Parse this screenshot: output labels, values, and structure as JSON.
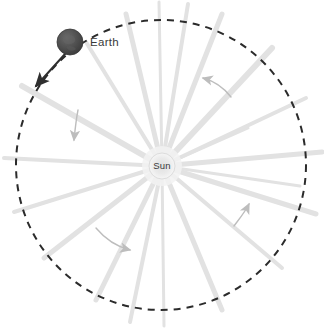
{
  "figure": {
    "background_color": "#ffffff"
  },
  "sun": {
    "label": "Sun",
    "center_x": 162,
    "center_y": 166,
    "radius": 13,
    "fill_color": "#e6e6e6",
    "label_color": "#4a4a4a"
  },
  "earth": {
    "label": "Earth",
    "center_x": 70,
    "center_y": 42,
    "radius": 13,
    "fill_color": "#4a4a4a",
    "label_color": "#3a3a3a",
    "label_x": 90,
    "label_y": 46
  },
  "orbit": {
    "name": "orbit-path",
    "center_x": 161,
    "center_y": 165,
    "radius": 145,
    "stroke_color": "#2b2b2b",
    "stroke_width": 2,
    "dash_pattern": "7 6"
  },
  "velocity_arrow": {
    "name": "earth-velocity-arrow",
    "color": "#2f2f2f",
    "from_x": 66,
    "from_y": 54,
    "to_x": 36,
    "to_y": 86,
    "description": "Earth velocity direction, tangent to orbit, pointing down-left"
  },
  "rays": {
    "color": "#e2e2e2",
    "count": 18,
    "description": "Sunlight rays radiating from the Sun outward past the orbit",
    "angles_deg": [
      5,
      25,
      48,
      70,
      88,
      103,
      122,
      140,
      158,
      178,
      196,
      212,
      232,
      250,
      268,
      288,
      310,
      332
    ]
  },
  "direction_arrows": [
    {
      "name": "direction-arrow-upper-right",
      "color": "#bdbdbd",
      "description": "curved arrow pointing up-left in upper right quadrant"
    },
    {
      "name": "direction-arrow-upper-left",
      "color": "#bdbdbd",
      "description": "short arrow pointing down in upper left quadrant"
    },
    {
      "name": "direction-arrow-lower-left",
      "color": "#bdbdbd",
      "description": "curved arrow pointing right-down in lower left quadrant"
    },
    {
      "name": "direction-arrow-lower-right",
      "color": "#bdbdbd",
      "description": "curved arrow pointing up-right in lower right quadrant"
    }
  ]
}
